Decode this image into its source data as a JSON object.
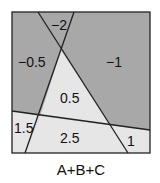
{
  "diagram": {
    "caption": "A+B+C",
    "colors": {
      "dark": "#a8a8a8",
      "light": "#e6e6e6",
      "line": "#222222"
    },
    "regions": [
      {
        "label": "-2",
        "shade": "dark"
      },
      {
        "label": "-0.5",
        "shade": "dark"
      },
      {
        "label": "-1",
        "shade": "dark"
      },
      {
        "label": "0.5",
        "shade": "light"
      },
      {
        "label": "1.5",
        "shade": "light"
      },
      {
        "label": "2.5",
        "shade": "light"
      },
      {
        "label": "1",
        "shade": "light"
      }
    ]
  }
}
